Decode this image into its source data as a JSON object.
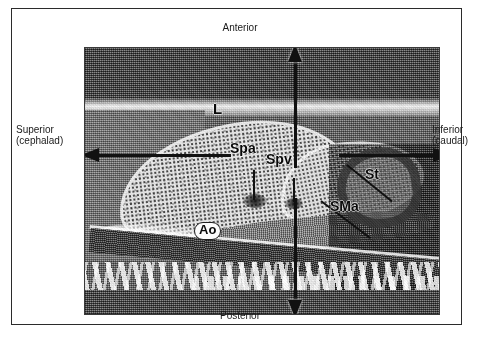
{
  "figure": {
    "modality": "ultrasound-sonogram",
    "view": "longitudinal-upper-abdomen"
  },
  "orientation": {
    "top": {
      "label": "Anterior",
      "icon": "arrow-up-icon"
    },
    "bottom": {
      "label": "Posterior",
      "icon": "arrow-down-icon"
    },
    "left": {
      "line1": "Superior",
      "line2": "(cephalad)",
      "icon": "arrow-left-icon"
    },
    "right": {
      "line1": "Inferior",
      "line2": "(caudal)",
      "icon": "arrow-right-icon"
    }
  },
  "annotations": [
    {
      "key": "L",
      "label": "L",
      "meaning": "liver"
    },
    {
      "key": "Spa",
      "label": "Spa",
      "meaning": "splenic-artery"
    },
    {
      "key": "Spv",
      "label": "Spv",
      "meaning": "splenic-vein"
    },
    {
      "key": "St",
      "label": "St",
      "meaning": "stomach"
    },
    {
      "key": "SMa",
      "label": "SMa",
      "meaning": "superior-mesenteric-artery"
    },
    {
      "key": "Ao",
      "label": "Ao",
      "meaning": "aorta"
    }
  ],
  "labels": {
    "liver": "L",
    "splenic_artery": "Spa",
    "splenic_vein": "Spv",
    "stomach": "St",
    "superior_mesenteric_artery": "SMa",
    "aorta": "Ao"
  },
  "colors": {
    "ink": "#0d0d0d",
    "frame": "#2b2b2b",
    "page": "#ffffff",
    "scan_mid_gray": "#8a8a8a",
    "scan_dark_gray": "#6a6a6a",
    "liver_speckle": "#e6e6e6"
  }
}
